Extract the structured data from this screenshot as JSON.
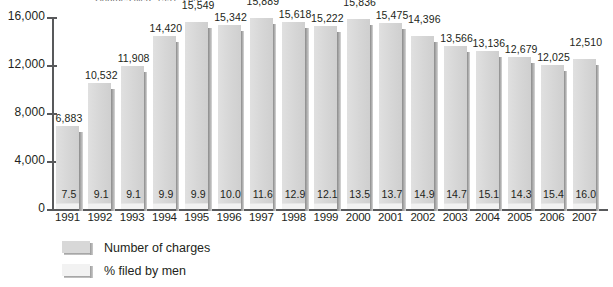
{
  "chart_data": {
    "type": "bar",
    "title": "Charges filed, 1991–2007",
    "xlabel": "",
    "ylabel": "",
    "ylim": [
      0,
      16000
    ],
    "yticks": [
      0,
      4000,
      8000,
      12000,
      16000
    ],
    "ytick_labels": [
      "0",
      "4,000",
      "8,000",
      "12,000",
      "16,000"
    ],
    "grid": false,
    "legend_position": "bottom-left",
    "categories": [
      "1991",
      "1992",
      "1993",
      "1994",
      "1995",
      "1996",
      "1997",
      "1998",
      "1999",
      "2000",
      "2001",
      "2002",
      "2003",
      "2004",
      "2005",
      "2006",
      "2007"
    ],
    "series": [
      {
        "name": "Number of charges",
        "values": [
          6883,
          10532,
          11908,
          14420,
          15549,
          15342,
          15889,
          15618,
          15222,
          15836,
          15475,
          14396,
          13566,
          13136,
          12679,
          12025,
          12510
        ],
        "labels": [
          "6,883",
          "10,532",
          "11,908",
          "14,420",
          "15,549",
          "15,342",
          "15,889",
          "15,618",
          "15,222",
          "15,836",
          "15,475",
          "14,396",
          "13,566",
          "13,136",
          "12,679",
          "12,025",
          "12,510"
        ],
        "color": "#d8d8d8"
      },
      {
        "name": "% filed by men",
        "values": [
          7.5,
          9.1,
          9.1,
          9.9,
          9.9,
          10.0,
          11.6,
          12.9,
          12.1,
          13.5,
          13.7,
          14.9,
          14.7,
          15.1,
          14.3,
          15.4,
          16.0
        ],
        "labels": [
          "7.5",
          "9.1",
          "9.1",
          "9.9",
          "9.9",
          "10.0",
          "11.6",
          "12.9",
          "12.1",
          "13.5",
          "13.7",
          "14.9",
          "14.7",
          "15.1",
          "14.3",
          "15.4",
          "16.0"
        ],
        "color": "#f2f2f2"
      }
    ]
  },
  "legend": {
    "items": [
      {
        "label": "Number of charges",
        "swatch": "charges-swatch"
      },
      {
        "label": "% filed by men",
        "swatch": "pct-swatch"
      }
    ]
  }
}
